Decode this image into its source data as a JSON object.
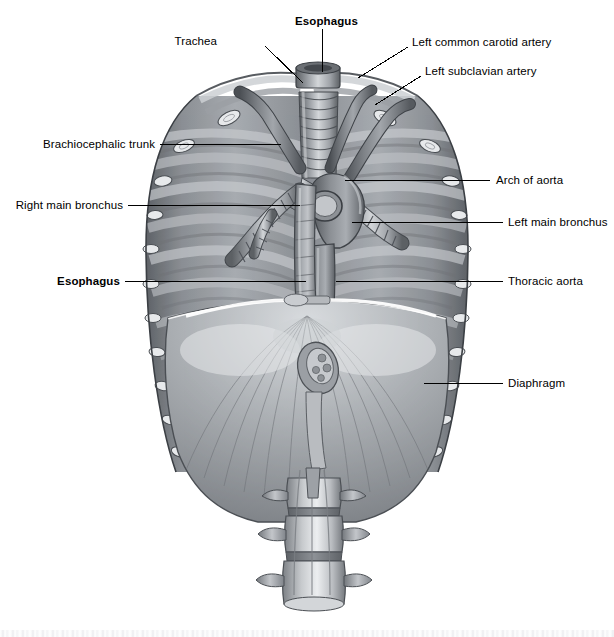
{
  "figure": {
    "background_color": "#ffffff",
    "line_color": "#000000",
    "label_color": "#000000"
  },
  "labels": [
    {
      "id": "esophagus-top",
      "text": "Esophagus",
      "bold": true,
      "align": "center",
      "x": 295,
      "y": 16,
      "leader": [
        [
          322,
          29
        ],
        [
          322,
          72
        ]
      ]
    },
    {
      "id": "trachea",
      "text": "Trachea",
      "bold": false,
      "align": "right",
      "x": 217,
      "y": 36,
      "leader": [
        [
          265,
          46
        ],
        [
          303,
          83
        ]
      ]
    },
    {
      "id": "left-common-carotid",
      "text": "Left common carotid artery",
      "bold": false,
      "align": "left",
      "x": 412,
      "y": 37,
      "leader": [
        [
          408,
          47
        ],
        [
          358,
          78
        ]
      ]
    },
    {
      "id": "left-subclavian",
      "text": "Left subclavian artery",
      "bold": false,
      "align": "left",
      "x": 425,
      "y": 66,
      "leader": [
        [
          421,
          76
        ],
        [
          375,
          105
        ]
      ]
    },
    {
      "id": "brachiocephalic-trunk",
      "text": "Brachiocephalic trunk",
      "bold": false,
      "align": "right",
      "x": 46,
      "y": 139,
      "leader": [
        [
          160,
          144
        ],
        [
          281,
          144
        ]
      ]
    },
    {
      "id": "arch-of-aorta",
      "text": "Arch of aorta",
      "bold": false,
      "align": "left",
      "x": 496,
      "y": 175,
      "leader": [
        [
          490,
          180
        ],
        [
          345,
          180
        ]
      ]
    },
    {
      "id": "right-main-bronchus",
      "text": "Right main bronchus",
      "bold": false,
      "align": "right",
      "x": 20,
      "y": 200,
      "leader": [
        [
          128,
          205
        ],
        [
          300,
          205
        ]
      ]
    },
    {
      "id": "left-main-bronchus",
      "text": "Left main bronchus",
      "bold": false,
      "align": "left",
      "x": 508,
      "y": 217,
      "leader": [
        [
          503,
          222
        ],
        [
          352,
          222
        ]
      ]
    },
    {
      "id": "esophagus-left",
      "text": "Esophagus",
      "bold": true,
      "align": "right",
      "x": 62,
      "y": 276,
      "leader": [
        [
          125,
          281
        ],
        [
          306,
          281
        ]
      ]
    },
    {
      "id": "thoracic-aorta",
      "text": "Thoracic aorta",
      "bold": false,
      "align": "left",
      "x": 508,
      "y": 276,
      "leader": [
        [
          503,
          281
        ],
        [
          336,
          281
        ]
      ]
    },
    {
      "id": "diaphragm",
      "text": "Diaphragm",
      "bold": false,
      "align": "left",
      "x": 508,
      "y": 378,
      "leader": [
        [
          503,
          383
        ],
        [
          424,
          383
        ]
      ]
    }
  ],
  "structures": [
    {
      "name": "trachea",
      "description": "cartilage-ringed airway descending in the midline from the neck"
    },
    {
      "name": "right-main-bronchus",
      "description": "ringed airway branching to the right lung"
    },
    {
      "name": "left-main-bronchus",
      "description": "ringed airway branching to the left lung"
    },
    {
      "name": "esophagus",
      "description": "muscular tube descending behind the trachea through the diaphragm"
    },
    {
      "name": "arch-of-aorta",
      "description": "curved great vessel arching over the left main bronchus"
    },
    {
      "name": "thoracic-aorta",
      "description": "descending aorta running along the vertebral column"
    },
    {
      "name": "brachiocephalic-trunk",
      "description": "first branch of the aortic arch"
    },
    {
      "name": "left-common-carotid-artery",
      "description": "second branch of the aortic arch"
    },
    {
      "name": "left-subclavian-artery",
      "description": "third branch of the aortic arch"
    },
    {
      "name": "diaphragm",
      "description": "dome-shaped muscle forming the floor of the thorax"
    },
    {
      "name": "esophageal-hiatus",
      "description": "opening in the diaphragm transmitting the esophagus"
    },
    {
      "name": "rib-cage",
      "description": "cut ribs seen from inside, posterior view"
    },
    {
      "name": "lumbar-vertebrae",
      "description": "vertebral bodies with transverse processes below the diaphragm"
    }
  ]
}
